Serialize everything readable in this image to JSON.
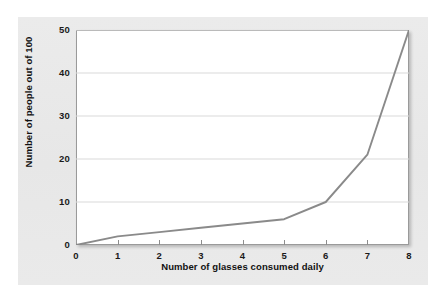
{
  "figure": {
    "background_color": "#ffffff",
    "panel_color": "#e9e9e9",
    "plot_background_color": "#ffffff",
    "plot_border_color": "#9a9a9a",
    "gridline_color": "#d9d9d9",
    "line_color": "#8a8a8a",
    "text_color": "#111111"
  },
  "chart_data": {
    "type": "line",
    "title": "",
    "subtitle": "",
    "xlabel": "Number of glasses consumed daily",
    "ylabel": "Number of people out of 100",
    "xlim": [
      0,
      8
    ],
    "ylim": [
      0,
      50
    ],
    "xticks": [
      "0",
      "1",
      "2",
      "3",
      "4",
      "5",
      "6",
      "7",
      "8"
    ],
    "yticks": [
      "0",
      "10",
      "20",
      "30",
      "40",
      "50"
    ],
    "grid": "horizontal",
    "legend": null,
    "legend_position": "none",
    "annotations": [],
    "x": [
      0,
      1,
      2,
      3,
      4,
      5,
      6,
      7,
      8
    ],
    "series": [
      {
        "name": "People out of 100",
        "values": [
          0,
          2,
          3,
          4,
          5,
          6,
          10,
          21,
          50
        ],
        "color": "#8a8a8a"
      }
    ]
  }
}
